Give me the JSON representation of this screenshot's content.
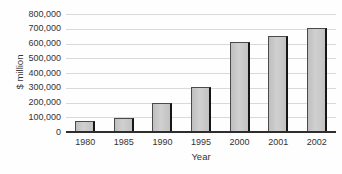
{
  "chart_data": {
    "type": "bar",
    "categories": [
      "1980",
      "1985",
      "1990",
      "1995",
      "2000",
      "2001",
      "2002"
    ],
    "values": [
      78000,
      95000,
      195000,
      305000,
      610000,
      650000,
      705000
    ],
    "title": "",
    "xlabel": "Year",
    "ylabel": "$ million",
    "ylim": [
      0,
      800000
    ],
    "ytick_step": 100000,
    "ytick_labels": [
      "0",
      "100,000",
      "200,000",
      "300,000",
      "400,000",
      "500,000",
      "600,000",
      "700,000",
      "800,000"
    ],
    "grid": true,
    "legend": "none",
    "colors": {
      "bar_fill": "#c9c9c9",
      "bar_border": "#4a4a4a",
      "bar_right_shadow": "#161616",
      "gridline": "#d9d9d9",
      "axis_line": "#2e2e2e",
      "text": "#333333",
      "background": "#fefefe"
    }
  }
}
